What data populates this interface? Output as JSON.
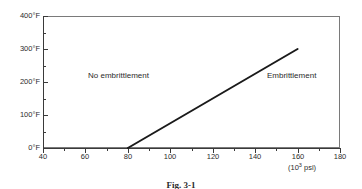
{
  "figure": {
    "caption": "Fig. 3-1"
  },
  "chart_data": {
    "type": "line",
    "title": "",
    "xlabel": "(10³ psi)",
    "ylabel": "",
    "xlim": [
      40,
      180
    ],
    "ylim": [
      0,
      400
    ],
    "x_major_ticks": [
      40,
      60,
      80,
      100,
      120,
      140,
      160,
      180
    ],
    "x_minor_ticks": [
      50,
      70,
      90,
      110,
      130,
      150,
      170
    ],
    "x_tick_labels": [
      "40",
      "60",
      "80",
      "100",
      "120",
      "140",
      "160",
      "180"
    ],
    "y_major_ticks": [
      0,
      100,
      200,
      300,
      400
    ],
    "y_minor_ticks": [
      50,
      150,
      250,
      350
    ],
    "y_tick_labels": [
      "0°F",
      "100°F",
      "200°F",
      "300°F",
      "400°F"
    ],
    "grid": false,
    "legend": null,
    "series": [
      {
        "name": "Embrittlement threshold",
        "x": [
          80,
          160
        ],
        "y": [
          0,
          300
        ],
        "color": "#1a1a1a",
        "linewidth": 2
      }
    ],
    "annotations": [
      {
        "text": "No embrittlement",
        "x": 85,
        "y": 205
      },
      {
        "text": "Embrittlement",
        "x": 160,
        "y": 205
      }
    ],
    "x_axis_unit_label": {
      "prefix": "(10",
      "exponent": "3",
      "suffix": " psi)"
    }
  },
  "axis": {
    "x_title_prefix": "(10",
    "x_title_exponent": "3",
    "x_title_suffix": " psi)"
  },
  "regions": {
    "left_label": "No embrittlement",
    "right_label": "Embrittlement"
  },
  "colors": {
    "line": "#1a1a1a",
    "frame": "#7a7a7a",
    "axis": "#3a3a3a",
    "text": "#2b2b2b",
    "background": "#ffffff"
  }
}
